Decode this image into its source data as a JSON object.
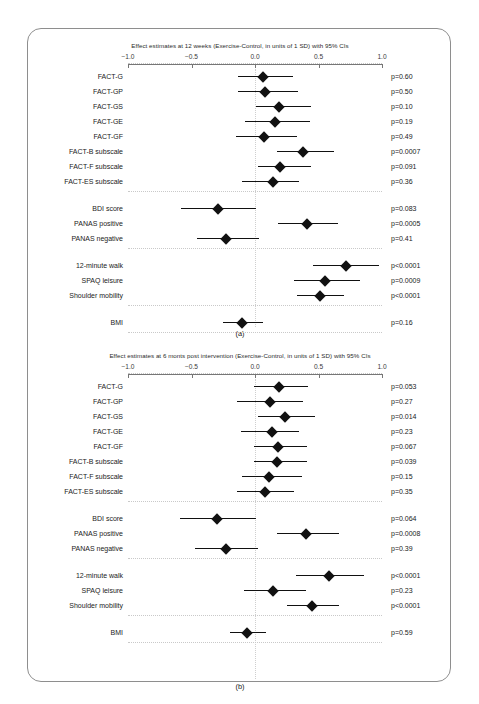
{
  "figure": {
    "panel_letter_a": "(a)",
    "panel_letter_b": "(b)",
    "bottom_caption": ""
  },
  "chart_data": [
    {
      "type": "scatter",
      "panel": "(a)",
      "title": "Effect estimates at 12 weeks (Exercise-Control, in units of 1 SD) with 95% CIs",
      "xlabel": "",
      "ylabel": "",
      "xlim": [
        -1.0,
        1.0
      ],
      "xticks": [
        -1.0,
        -0.5,
        0.0,
        0.5,
        1.0
      ],
      "xticklabels": [
        "−1.0",
        "−0.5",
        "0.0",
        "0.5",
        "1.0"
      ],
      "reference_line": 0.0,
      "grid": false,
      "legend": "none",
      "groups": [
        {
          "rows": [
            {
              "label": "FACT-G",
              "estimate": 0.06,
              "ci_low": -0.13,
              "ci_high": 0.3,
              "p_label": "p=0.60"
            },
            {
              "label": "FACT-GP",
              "estimate": 0.08,
              "ci_low": -0.13,
              "ci_high": 0.34,
              "p_label": "p=0.50"
            },
            {
              "label": "FACT-GS",
              "estimate": 0.19,
              "ci_low": 0.01,
              "ci_high": 0.44,
              "p_label": "p=0.10"
            },
            {
              "label": "FACT-GE",
              "estimate": 0.16,
              "ci_low": -0.08,
              "ci_high": 0.43,
              "p_label": "p=0.19"
            },
            {
              "label": "FACT-GF",
              "estimate": 0.07,
              "ci_low": -0.15,
              "ci_high": 0.33,
              "p_label": "p=0.49"
            },
            {
              "label": "FACT-B subscale",
              "estimate": 0.38,
              "ci_low": 0.17,
              "ci_high": 0.62,
              "p_label": "p=0.0007"
            },
            {
              "label": "FACT-F subscale",
              "estimate": 0.2,
              "ci_low": 0.02,
              "ci_high": 0.44,
              "p_label": "p=0.091"
            },
            {
              "label": "FACT-ES subscale",
              "estimate": 0.14,
              "ci_low": -0.1,
              "ci_high": 0.35,
              "p_label": "p=0.36"
            }
          ]
        },
        {
          "rows": [
            {
              "label": "BDI score",
              "estimate": -0.29,
              "ci_low": -0.58,
              "ci_high": 0.01,
              "p_label": "p=0.083"
            },
            {
              "label": "PANAS positive",
              "estimate": 0.41,
              "ci_low": 0.18,
              "ci_high": 0.65,
              "p_label": "p=0.0005"
            },
            {
              "label": "PANAS negative",
              "estimate": -0.23,
              "ci_low": -0.46,
              "ci_high": 0.03,
              "p_label": "p=0.41"
            }
          ]
        },
        {
          "rows": [
            {
              "label": "12-minute walk",
              "estimate": 0.72,
              "ci_low": 0.46,
              "ci_high": 0.98,
              "p_label": "p<0.0001"
            },
            {
              "label": "SPAQ leisure",
              "estimate": 0.55,
              "ci_low": 0.31,
              "ci_high": 0.83,
              "p_label": "p=0.0009"
            },
            {
              "label": "Shoulder mobility",
              "estimate": 0.51,
              "ci_low": 0.33,
              "ci_high": 0.7,
              "p_label": "p<0.0001"
            }
          ]
        },
        {
          "rows": [
            {
              "label": "BMI",
              "estimate": -0.1,
              "ci_low": -0.25,
              "ci_high": 0.06,
              "p_label": "p=0.16"
            }
          ]
        }
      ]
    },
    {
      "type": "scatter",
      "panel": "(b)",
      "title": "Effect estimates at 6 monts post intervention (Exercise-Control, in units of 1 SD) with 95% CIs",
      "xlabel": "",
      "ylabel": "",
      "xlim": [
        -1.0,
        1.0
      ],
      "xticks": [
        -1.0,
        -0.5,
        0.0,
        0.5,
        1.0
      ],
      "xticklabels": [
        "−1.0",
        "−0.5",
        "0.0",
        "0.5",
        "1.0"
      ],
      "reference_line": 0.0,
      "grid": false,
      "legend": "none",
      "groups": [
        {
          "rows": [
            {
              "label": "FACT-G",
              "estimate": 0.19,
              "ci_low": -0.01,
              "ci_high": 0.42,
              "p_label": "p=0.053"
            },
            {
              "label": "FACT-GP",
              "estimate": 0.12,
              "ci_low": -0.14,
              "ci_high": 0.38,
              "p_label": "p=0.27"
            },
            {
              "label": "FACT-GS",
              "estimate": 0.24,
              "ci_low": 0.02,
              "ci_high": 0.47,
              "p_label": "p=0.014"
            },
            {
              "label": "FACT-GE",
              "estimate": 0.13,
              "ci_low": -0.11,
              "ci_high": 0.35,
              "p_label": "p=0.23"
            },
            {
              "label": "FACT-GF",
              "estimate": 0.18,
              "ci_low": -0.01,
              "ci_high": 0.41,
              "p_label": "p=0.067"
            },
            {
              "label": "FACT-B subscale",
              "estimate": 0.17,
              "ci_low": -0.01,
              "ci_high": 0.41,
              "p_label": "p=0.039"
            },
            {
              "label": "FACT-F subscale",
              "estimate": 0.11,
              "ci_low": -0.1,
              "ci_high": 0.37,
              "p_label": "p=0.15"
            },
            {
              "label": "FACT-ES subscale",
              "estimate": 0.08,
              "ci_low": -0.14,
              "ci_high": 0.31,
              "p_label": "p=0.35"
            }
          ]
        },
        {
          "rows": [
            {
              "label": "BDI score",
              "estimate": -0.3,
              "ci_low": -0.59,
              "ci_high": 0.01,
              "p_label": "p=0.064"
            },
            {
              "label": "PANAS positive",
              "estimate": 0.4,
              "ci_low": 0.17,
              "ci_high": 0.66,
              "p_label": "p=0.0008"
            },
            {
              "label": "PANAS negative",
              "estimate": -0.23,
              "ci_low": -0.47,
              "ci_high": 0.02,
              "p_label": "p=0.39"
            }
          ]
        },
        {
          "rows": [
            {
              "label": "12-minute walk",
              "estimate": 0.58,
              "ci_low": 0.32,
              "ci_high": 0.86,
              "p_label": "p<0.0001"
            },
            {
              "label": "SPAQ leisure",
              "estimate": 0.14,
              "ci_low": -0.09,
              "ci_high": 0.4,
              "p_label": "p=0.23"
            },
            {
              "label": "Shoulder mobility",
              "estimate": 0.45,
              "ci_low": 0.25,
              "ci_high": 0.66,
              "p_label": "p<0.0001"
            }
          ]
        },
        {
          "rows": [
            {
              "label": "BMI",
              "estimate": -0.06,
              "ci_low": -0.2,
              "ci_high": 0.09,
              "p_label": "p=0.59"
            }
          ]
        }
      ]
    }
  ]
}
